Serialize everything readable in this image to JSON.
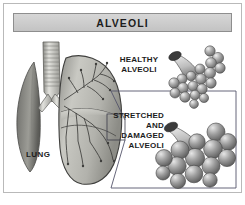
{
  "figure": {
    "title": "ALVEOLI",
    "domain_note": "grayscale medical illustration of lung and alveoli",
    "colors": {
      "title_bar_fill": "#cccccc",
      "title_bar_border": "#8e8e8e",
      "frame_border": "#b9b9b9",
      "background": "#ffffff",
      "text": "#1c1c1c",
      "callout_line": "#55556b",
      "alveoli_light": "#d9d9d9",
      "alveoli_mid": "#9a9a9a",
      "alveoli_dark": "#5d5d5d",
      "lung_light": "#d2d2cc",
      "lung_mid": "#a8a8a2",
      "lung_dark": "#4a4a48"
    }
  },
  "diagram": {
    "lung_label": "LUNG",
    "parts": [
      {
        "name": "trachea",
        "description": "cartilage-ringed airway at top center"
      },
      {
        "name": "left-lung",
        "description": "partially visible dark lung at far left"
      },
      {
        "name": "right-lung",
        "description": "large sectioned lung showing bronchial tree"
      },
      {
        "name": "bronchial-tree",
        "description": "branching airways inside right lung"
      }
    ]
  },
  "callout": {
    "items": [
      {
        "label_lines": [
          "HEALTHY",
          "ALVEOLI"
        ],
        "label": "HEALTHY ALVEOLI",
        "align": "center",
        "cluster": "many small grape-like sacs on a bronchiole"
      },
      {
        "label_lines": [
          "STRETCHED",
          "AND",
          "DAMAGED",
          "ALVEOLI"
        ],
        "label": "STRETCHED AND DAMAGED ALVEOLI",
        "align": "right",
        "cluster": "fewer, enlarged merged sacs on a bronchiole"
      }
    ]
  }
}
